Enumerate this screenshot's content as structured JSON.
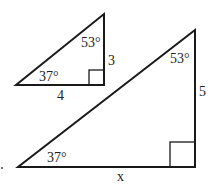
{
  "diagram": {
    "small_triangle": {
      "angle_bottom_left": "37°",
      "angle_top": "53°",
      "side_vertical": "3",
      "side_horizontal": "4",
      "vertices": {
        "bottom_left": [
          16,
          85
        ],
        "bottom_right": [
          104,
          85
        ],
        "top": [
          104,
          14
        ]
      },
      "right_angle_box": {
        "x": 89,
        "y": 70,
        "size": 15
      }
    },
    "large_triangle": {
      "angle_bottom_left": "37°",
      "angle_top": "53°",
      "side_vertical": "5",
      "side_horizontal": "x",
      "vertices": {
        "bottom_left": [
          18,
          167
        ],
        "bottom_right": [
          195,
          167
        ],
        "top": [
          195,
          30
        ]
      },
      "right_angle_box": {
        "x": 170,
        "y": 142,
        "size": 25
      }
    },
    "stray_mark": "."
  }
}
